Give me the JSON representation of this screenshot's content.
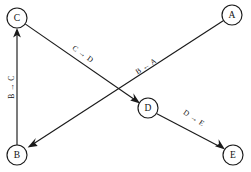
{
  "diagram": {
    "type": "directed-graph",
    "background_color": "#ffffff",
    "stroke_color": "#1a1a1a",
    "nodes": [
      {
        "id": "C",
        "label": "C",
        "x": 17,
        "y": 18,
        "r": 10
      },
      {
        "id": "A",
        "label": "A",
        "x": 232,
        "y": 15,
        "r": 10
      },
      {
        "id": "D",
        "label": "D",
        "x": 148,
        "y": 108,
        "r": 10
      },
      {
        "id": "B",
        "label": "B",
        "x": 17,
        "y": 155,
        "r": 10
      },
      {
        "id": "E",
        "label": "E",
        "x": 233,
        "y": 155,
        "r": 10
      }
    ],
    "edges": [
      {
        "id": "b-to-c",
        "label": "B → C",
        "from": "B",
        "to": "C",
        "label_x": 11,
        "label_y": 87,
        "label_rotation": -90
      },
      {
        "id": "c-to-d",
        "label": "C → D",
        "from": "C",
        "to": "D",
        "label_x": 83,
        "label_y": 54,
        "label_rotation": 36
      },
      {
        "id": "a-to-b",
        "label": "B ← A",
        "from": "A",
        "to": "B",
        "label_x": 146,
        "label_y": 66,
        "label_rotation": -33
      },
      {
        "id": "d-to-e",
        "label": "D → E",
        "from": "D",
        "to": "E",
        "label_x": 194,
        "label_y": 118,
        "label_rotation": 34
      }
    ]
  }
}
